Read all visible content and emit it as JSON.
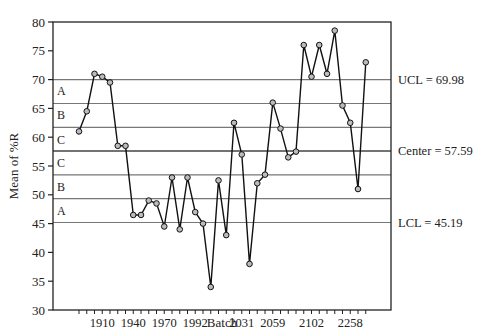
{
  "chart_data": {
    "type": "line",
    "title": "",
    "xlabel": "Batch",
    "ylabel": "Mean of %R",
    "ylim": [
      30,
      80
    ],
    "yticks": [
      30,
      35,
      40,
      45,
      50,
      55,
      60,
      65,
      70,
      75,
      80
    ],
    "xtick_labels": [
      {
        "label": "1910",
        "index": 3
      },
      {
        "label": "1940",
        "index": 7
      },
      {
        "label": "1970",
        "index": 11
      },
      {
        "label": "1992",
        "index": 15
      },
      {
        "label": "2031",
        "index": 21
      },
      {
        "label": "2059",
        "index": 25
      },
      {
        "label": "2102",
        "index": 30
      },
      {
        "label": "2258",
        "index": 35
      }
    ],
    "control_lines": {
      "ucl": {
        "value": 69.98,
        "label": "UCL = 69.98"
      },
      "center": {
        "value": 57.59,
        "label": "Center = 57.59"
      },
      "lcl": {
        "value": 45.19,
        "label": "LCL = 45.19"
      }
    },
    "zone_lines": [
      65.85,
      61.72,
      53.46,
      49.32
    ],
    "zone_labels": [
      {
        "label": "A",
        "y": 68.0
      },
      {
        "label": "B",
        "y": 63.8
      },
      {
        "label": "C",
        "y": 59.6
      },
      {
        "label": "C",
        "y": 55.5
      },
      {
        "label": "B",
        "y": 51.4
      },
      {
        "label": "A",
        "y": 47.2
      }
    ],
    "series": [
      {
        "name": "Mean of %R",
        "values": [
          61,
          64.5,
          71,
          70.5,
          69.5,
          58.5,
          58.5,
          46.5,
          46.5,
          49,
          48.5,
          44.5,
          53,
          44,
          53,
          47,
          45,
          34,
          52.5,
          43,
          62.5,
          57,
          38,
          52,
          53.5,
          66,
          61.5,
          56.5,
          57.5,
          76,
          70.5,
          76,
          71,
          78.5,
          65.5,
          62.5,
          51,
          73
        ]
      }
    ],
    "grid": false,
    "legend": "none"
  }
}
